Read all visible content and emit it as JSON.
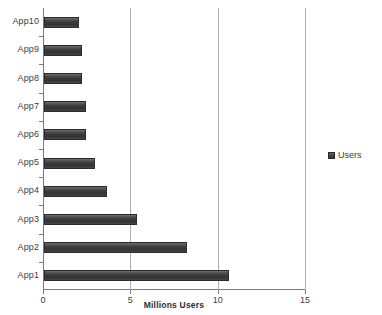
{
  "chart_data": {
    "type": "bar",
    "orientation": "horizontal",
    "title": "",
    "xlabel": "Millions Users",
    "ylabel": "",
    "categories": [
      "App1",
      "App2",
      "App3",
      "App4",
      "App5",
      "App6",
      "App7",
      "App8",
      "App9",
      "App10"
    ],
    "values": [
      10.6,
      8.2,
      5.3,
      3.6,
      2.9,
      2.4,
      2.4,
      2.2,
      2.2,
      2.0
    ],
    "series": [
      {
        "name": "Users",
        "values": [
          10.6,
          8.2,
          5.3,
          3.6,
          2.9,
          2.4,
          2.4,
          2.2,
          2.2,
          2.0
        ]
      }
    ],
    "xlim": [
      0,
      15
    ],
    "xticks": [
      0,
      5,
      10,
      15
    ],
    "xtick_labels": [
      "0",
      "5",
      "10",
      "15"
    ],
    "grid": "vertical",
    "legend": {
      "position": "right",
      "entries": [
        "Users"
      ]
    },
    "colors": {
      "bar": "#3a3a3a",
      "bar_edge": "#2b2b2b",
      "gridline": "#b0b0b0",
      "axis": "#7a7a7a",
      "text": "#3d3d3d",
      "background": "#ffffff"
    }
  }
}
